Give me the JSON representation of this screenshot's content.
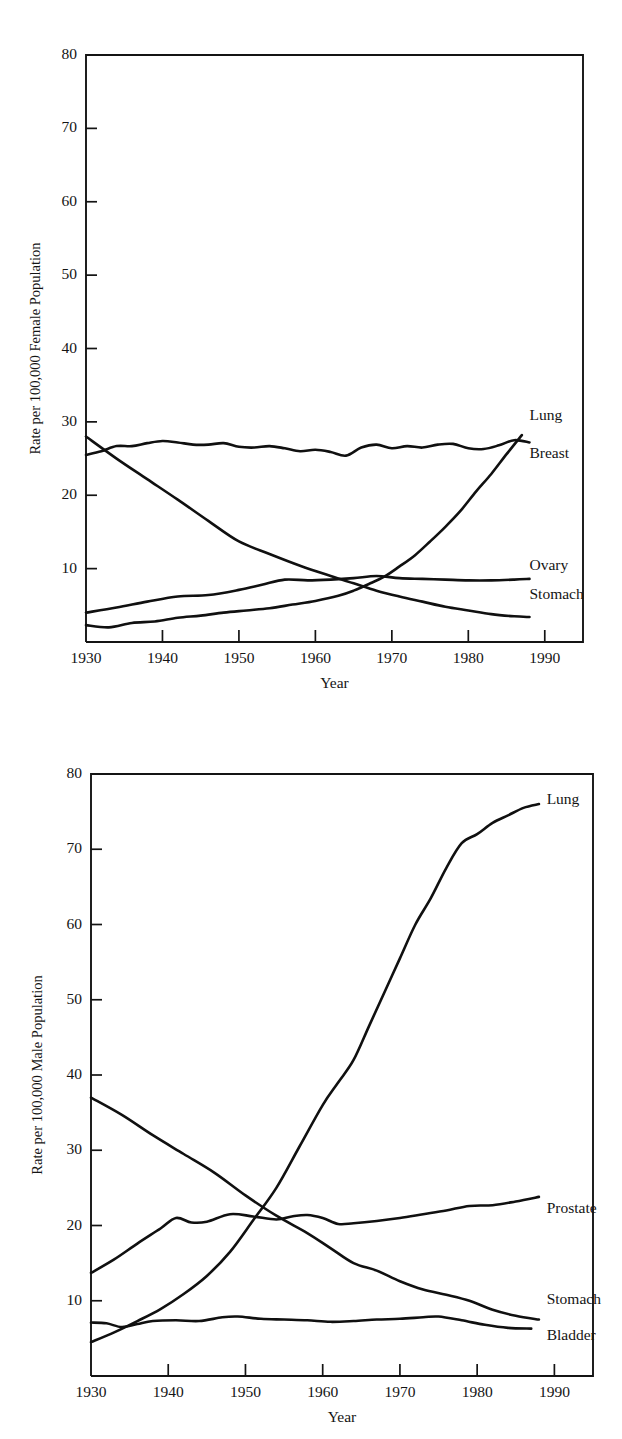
{
  "figures": [
    {
      "id": "female",
      "name": "female-cancer-death-rates-chart",
      "chart_data": {
        "type": "line",
        "title": "",
        "xlabel": "Year",
        "ylabel": "Rate per 100,000 Female Population",
        "xlim": [
          1930,
          1995
        ],
        "ylim": [
          0,
          80
        ],
        "xticks": [
          1930,
          1940,
          1950,
          1960,
          1970,
          1980,
          1990
        ],
        "xtick_labels": [
          "1930",
          "1940",
          "1950",
          "1960",
          "1970",
          "1980",
          "1990"
        ],
        "yticks": [
          10,
          20,
          30,
          40,
          50,
          60,
          70,
          80
        ],
        "ytick_labels": [
          "10",
          "20",
          "30",
          "40",
          "50",
          "60",
          "70",
          "80"
        ],
        "grid": false,
        "legend": "inline-right-labels",
        "series": [
          {
            "name": "Lung",
            "label": "Lung",
            "label_x": 1988,
            "label_y": 30.8,
            "x": [
              1930,
              1933,
              1936,
              1939,
              1942,
              1945,
              1948,
              1951,
              1954,
              1957,
              1960,
              1963,
              1965,
              1967,
              1969,
              1971,
              1973,
              1975,
              1977,
              1979,
              1981,
              1983,
              1985,
              1987
            ],
            "y": [
              2.3,
              2.0,
              2.6,
              2.8,
              3.3,
              3.6,
              4.0,
              4.3,
              4.6,
              5.1,
              5.6,
              6.3,
              7.0,
              7.9,
              8.9,
              10.3,
              11.8,
              13.7,
              15.7,
              17.9,
              20.5,
              22.9,
              25.6,
              28.2
            ]
          },
          {
            "name": "Breast",
            "label": "Breast",
            "label_x": 1988,
            "label_y": 25.5,
            "x": [
              1930,
              1932,
              1934,
              1936,
              1938,
              1940,
              1942,
              1944,
              1946,
              1948,
              1950,
              1952,
              1954,
              1956,
              1958,
              1960,
              1962,
              1964,
              1966,
              1968,
              1970,
              1972,
              1974,
              1976,
              1978,
              1980,
              1982,
              1984,
              1986,
              1988
            ],
            "y": [
              25.5,
              26.0,
              26.7,
              26.7,
              27.1,
              27.4,
              27.2,
              26.9,
              26.9,
              27.1,
              26.6,
              26.5,
              26.7,
              26.4,
              26.0,
              26.2,
              25.9,
              25.4,
              26.5,
              26.9,
              26.4,
              26.7,
              26.5,
              26.9,
              27.0,
              26.4,
              26.3,
              26.8,
              27.5,
              27.2
            ]
          },
          {
            "name": "Ovary",
            "label": "Ovary",
            "label_x": 1988,
            "label_y": 10.3,
            "x": [
              1930,
              1934,
              1938,
              1942,
              1946,
              1950,
              1953,
              1956,
              1959,
              1962,
              1965,
              1968,
              1971,
              1974,
              1977,
              1980,
              1983,
              1986,
              1988
            ],
            "y": [
              4.0,
              4.7,
              5.5,
              6.2,
              6.4,
              7.1,
              7.8,
              8.5,
              8.4,
              8.5,
              8.7,
              9.0,
              8.7,
              8.6,
              8.5,
              8.4,
              8.4,
              8.5,
              8.6
            ]
          },
          {
            "name": "Stomach",
            "label": "Stomach",
            "label_x": 1988,
            "label_y": 6.3,
            "x": [
              1930,
              1934,
              1938,
              1942,
              1946,
              1950,
              1954,
              1958,
              1962,
              1965,
              1968,
              1971,
              1974,
              1977,
              1980,
              1983,
              1986,
              1988
            ],
            "y": [
              28.0,
              25.0,
              22.2,
              19.4,
              16.5,
              13.7,
              12.0,
              10.4,
              9.0,
              8.0,
              7.0,
              6.2,
              5.5,
              4.8,
              4.3,
              3.8,
              3.5,
              3.4
            ]
          }
        ]
      }
    },
    {
      "id": "male",
      "name": "male-cancer-death-rates-chart",
      "chart_data": {
        "type": "line",
        "title": "",
        "xlabel": "Year",
        "ylabel": "Rate per 100,000 Male Population",
        "xlim": [
          1930,
          1995
        ],
        "ylim": [
          0,
          80
        ],
        "xticks": [
          1930,
          1940,
          1950,
          1960,
          1970,
          1980,
          1990
        ],
        "xtick_labels": [
          "1930",
          "1940",
          "1950",
          "1960",
          "1970",
          "1980",
          "1990"
        ],
        "yticks": [
          10,
          20,
          30,
          40,
          50,
          60,
          70,
          80
        ],
        "ytick_labels": [
          "10",
          "20",
          "30",
          "40",
          "50",
          "60",
          "70",
          "80"
        ],
        "grid": false,
        "legend": "inline-right-labels",
        "series": [
          {
            "name": "Lung",
            "label": "Lung",
            "label_x": 1989,
            "label_y": 76.5,
            "x": [
              1930,
              1933,
              1936,
              1939,
              1942,
              1945,
              1948,
              1951,
              1954,
              1957,
              1960,
              1962,
              1964,
              1966,
              1968,
              1970,
              1972,
              1974,
              1976,
              1978,
              1980,
              1982,
              1984,
              1986,
              1988
            ],
            "y": [
              4.5,
              5.8,
              7.3,
              8.9,
              10.9,
              13.3,
              16.5,
              20.7,
              25.0,
              30.5,
              36.0,
              39.0,
              42.0,
              46.5,
              51.0,
              55.5,
              60.0,
              63.5,
              67.5,
              70.8,
              72.0,
              73.5,
              74.5,
              75.5,
              76.0
            ]
          },
          {
            "name": "Prostate",
            "label": "Prostate",
            "label_x": 1989,
            "label_y": 22.2,
            "x": [
              1930,
              1933,
              1936,
              1939,
              1941,
              1943,
              1945,
              1948,
              1951,
              1954,
              1956,
              1958,
              1960,
              1962,
              1964,
              1967,
              1970,
              1973,
              1976,
              1979,
              1982,
              1985,
              1988
            ],
            "y": [
              13.7,
              15.5,
              17.6,
              19.6,
              21.0,
              20.4,
              20.5,
              21.5,
              21.2,
              20.8,
              21.2,
              21.4,
              21.0,
              20.2,
              20.3,
              20.6,
              21.0,
              21.5,
              22.0,
              22.6,
              22.7,
              23.2,
              23.8
            ]
          },
          {
            "name": "Stomach",
            "label": "Stomach",
            "label_x": 1989,
            "label_y": 10.0,
            "x": [
              1930,
              1934,
              1938,
              1942,
              1946,
              1950,
              1954,
              1958,
              1961,
              1964,
              1967,
              1970,
              1973,
              1976,
              1979,
              1982,
              1985,
              1988
            ],
            "y": [
              37.0,
              34.7,
              32.0,
              29.5,
              27.0,
              24.0,
              21.3,
              19.0,
              17.0,
              15.0,
              14.0,
              12.6,
              11.5,
              10.8,
              10.0,
              8.8,
              8.0,
              7.5
            ]
          },
          {
            "name": "Bladder",
            "label": "Bladder",
            "label_x": 1989,
            "label_y": 5.3,
            "x": [
              1930,
              1932,
              1934,
              1936,
              1938,
              1941,
              1944,
              1947,
              1949,
              1952,
              1955,
              1958,
              1961,
              1964,
              1967,
              1970,
              1973,
              1975,
              1978,
              1981,
              1984,
              1987
            ],
            "y": [
              7.1,
              7.0,
              6.5,
              6.9,
              7.3,
              7.4,
              7.3,
              7.8,
              7.9,
              7.6,
              7.5,
              7.4,
              7.2,
              7.3,
              7.5,
              7.6,
              7.8,
              7.9,
              7.4,
              6.8,
              6.4,
              6.3
            ]
          }
        ]
      }
    }
  ]
}
